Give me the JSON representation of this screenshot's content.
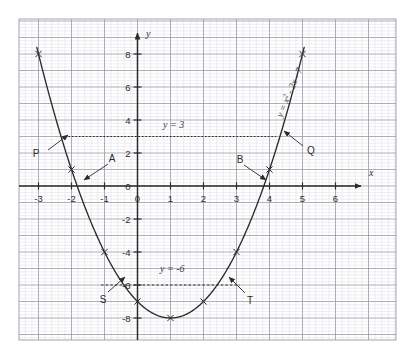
{
  "figure": {
    "background_color": "#ffffff",
    "grid": {
      "minor_color": "#dcdce4",
      "major_color": "#9a9aa8",
      "border_color": "#9a9aa8",
      "minor_step_units": 0.2,
      "major_step_units": 1
    },
    "axis_color": "#2b2b2b",
    "curve_color": "#2b2b2b",
    "dotted_color": "#2b2b2b"
  },
  "chart_data": {
    "type": "line",
    "title": "",
    "subtitle": "",
    "xlabel": "x",
    "ylabel": "y",
    "xlim": [
      -3.6,
      6.8
    ],
    "ylim": [
      -9.2,
      9.0
    ],
    "grid": true,
    "legend_position": "none",
    "x_ticks": [
      -3,
      -2,
      -1,
      0,
      1,
      2,
      3,
      4,
      5,
      6
    ],
    "x_tick_labels": [
      "-3",
      "-2",
      "-1",
      "0",
      "1",
      "2",
      "3",
      "4",
      "5",
      "6"
    ],
    "y_ticks": [
      8,
      6,
      4,
      2,
      0,
      -2,
      -4,
      -6,
      -8
    ],
    "y_tick_labels": [
      "8",
      "6",
      "4",
      "2",
      "0",
      "-2",
      "-4",
      "-6",
      "-8"
    ],
    "series": [
      {
        "name": "y = x^2 - 2x - 7",
        "type": "parabola",
        "equation_a": 1,
        "equation_b": -2,
        "equation_c": -7,
        "x_domain": [
          -3.05,
          5.05
        ],
        "x": [
          -3,
          -2,
          -1,
          0,
          1,
          2,
          3,
          4,
          5
        ],
        "values": [
          8,
          1,
          -4,
          -7,
          -8,
          -7,
          -4,
          1,
          8
        ],
        "marker": "x",
        "marker_x": [
          -3,
          -2,
          -1,
          0,
          1,
          2,
          3,
          4,
          5
        ]
      },
      {
        "name": "y = 3",
        "type": "horizontal-line",
        "style": "dotted",
        "y_value": 3,
        "x_from": -2.2,
        "x_to": 4.2
      },
      {
        "name": "y = -6",
        "type": "horizontal-line",
        "style": "dashed",
        "y_value": -6,
        "x_from": -1.1,
        "x_to": 3.1
      }
    ],
    "annotations": [
      {
        "id": "curve-equation",
        "text": "y = x² - 2x - 7",
        "rotated": true
      },
      {
        "id": "line-label-3",
        "text": "y = 3"
      },
      {
        "id": "line-label-neg6",
        "text": "y = -6"
      },
      {
        "id": "point-P",
        "text": "P",
        "describes": "left intersection of curve with y = 3",
        "point_x": -2.16,
        "point_y": 3
      },
      {
        "id": "point-Q",
        "text": "Q",
        "describes": "right intersection of curve with y = 3",
        "point_x": 4.16,
        "point_y": 3
      },
      {
        "id": "point-A",
        "text": "A",
        "describes": "left x-intercept of curve",
        "point_x": -1.83,
        "point_y": 0
      },
      {
        "id": "point-B",
        "text": "B",
        "describes": "right x-intercept of curve",
        "point_x": 3.83,
        "point_y": 0
      },
      {
        "id": "point-S",
        "text": "S",
        "describes": "left intersection of curve with y = -6",
        "point_x": -0.41,
        "point_y": -6
      },
      {
        "id": "point-T",
        "text": "T",
        "describes": "right intersection of curve with y = -6",
        "point_x": 2.41,
        "point_y": -6
      }
    ]
  },
  "labels": {
    "x_axis": "x",
    "y_axis": "y",
    "curve_equation_parts": {
      "lhs": "y = x",
      "exponent": "2",
      "rhs": " - 2x - 7"
    },
    "line_y3": "y = 3",
    "line_yneg6": "y = -6",
    "P": "P",
    "Q": "Q",
    "A": "A",
    "B": "B",
    "S": "S",
    "T": "T"
  }
}
